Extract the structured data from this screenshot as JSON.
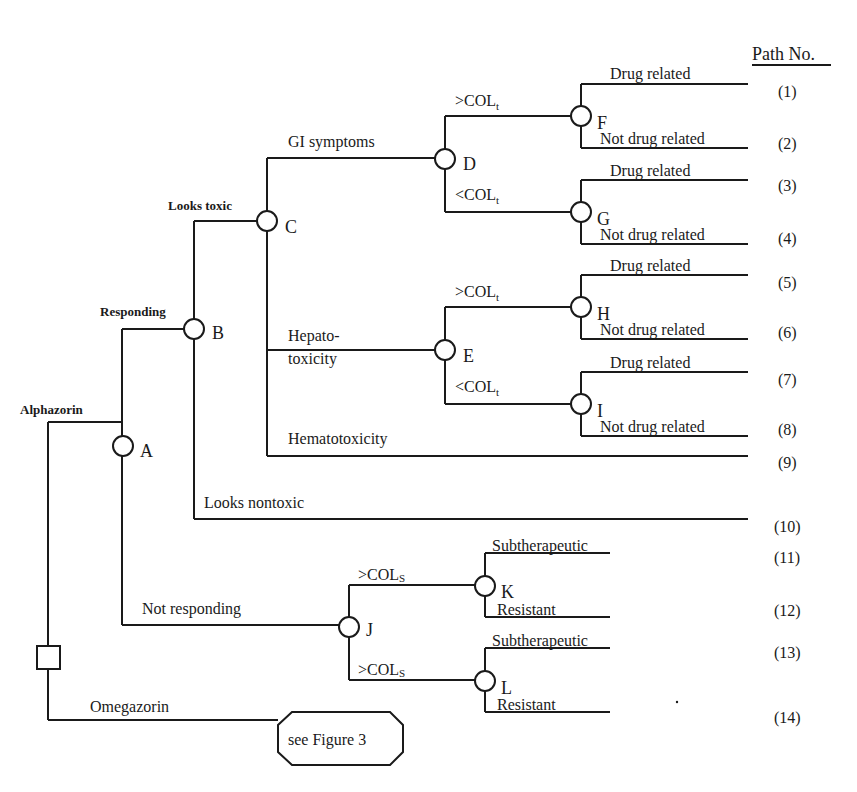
{
  "header": {
    "path_column_title": "Path No."
  },
  "root": {
    "type": "decision",
    "options": [
      "Alphazorin",
      "Omegazorin"
    ]
  },
  "nodes": {
    "A": "A",
    "B": "B",
    "C": "C",
    "D": "D",
    "E": "E",
    "F": "F",
    "G": "G",
    "H": "H",
    "I": "I",
    "J": "J",
    "K": "K",
    "L": "L"
  },
  "branches": {
    "alphazorin": "Alphazorin",
    "omegazorin": "Omegazorin",
    "responding": "Responding",
    "not_responding": "Not responding",
    "looks_toxic": "Looks toxic",
    "looks_nontoxic": "Looks nontoxic",
    "gi_symptoms": "GI symptoms",
    "hepato_line1": "Hepato-",
    "hepato_line2": "toxicity",
    "hematotoxicity": "Hematotoxicity",
    "col_gt": ">COL",
    "col_lt": "<COL",
    "col_sub_t": "t",
    "col_sub_s": "S",
    "drug_related": "Drug related",
    "not_drug_related": "Not drug related",
    "subtherapeutic": "Subtherapeutic",
    "resistant": "Resistant"
  },
  "terminal_reference": {
    "label": "see Figure 3"
  },
  "paths": [
    "(1)",
    "(2)",
    "(3)",
    "(4)",
    "(5)",
    "(6)",
    "(7)",
    "(8)",
    "(9)",
    "(10)",
    "(11)",
    "(12)",
    "(13)",
    "(14)"
  ],
  "colors": {
    "ink": "#1a1a1a",
    "background": "#ffffff"
  }
}
